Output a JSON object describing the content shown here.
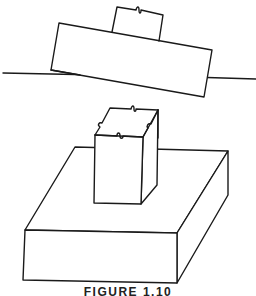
{
  "figure": {
    "caption": "FIGURE 1.10",
    "colors": {
      "line": "#1a1a1a",
      "background": "#ffffff"
    },
    "parts": [
      {
        "name": "tilted-block",
        "label": "tilted block on reference line"
      },
      {
        "name": "top-small-block",
        "label": "small block atop tilted block"
      },
      {
        "name": "reference-line",
        "label": "horizontal reference line with dashed hidden segment"
      },
      {
        "name": "post",
        "label": "square post with broken-top symbols"
      },
      {
        "name": "base-block",
        "label": "rectangular base block"
      }
    ]
  }
}
